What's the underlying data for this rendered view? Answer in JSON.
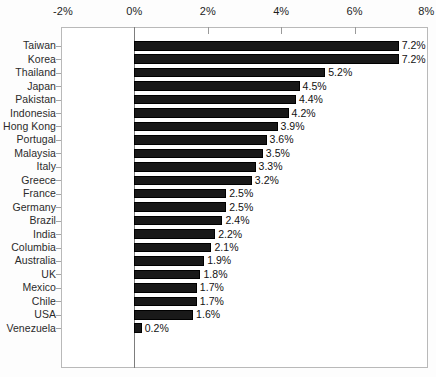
{
  "chart_data": {
    "type": "bar",
    "orientation": "horizontal",
    "title": "",
    "xlabel": "",
    "ylabel": "",
    "xlim": [
      -2,
      8
    ],
    "xticks": [
      "-2%",
      "0%",
      "2%",
      "4%",
      "6%",
      "8%"
    ],
    "xtick_values": [
      -2,
      0,
      2,
      4,
      6,
      8
    ],
    "grid": false,
    "legend": null,
    "value_suffix": "%",
    "categories": [
      "Taiwan",
      "Korea",
      "Thailand",
      "Japan",
      "Pakistan",
      "Indonesia",
      "Hong Kong",
      "Portugal",
      "Malaysia",
      "Italy",
      "Greece",
      "France",
      "Germany",
      "Brazil",
      "India",
      "Columbia",
      "Australia",
      "UK",
      "Mexico",
      "Chile",
      "USA",
      "Venezuela"
    ],
    "values": [
      7.2,
      7.2,
      5.2,
      4.5,
      4.4,
      4.2,
      3.9,
      3.6,
      3.5,
      3.3,
      3.2,
      2.5,
      2.5,
      2.4,
      2.2,
      2.1,
      1.9,
      1.8,
      1.7,
      1.7,
      1.6,
      0.2
    ],
    "value_labels": [
      "7.2%",
      "7.2%",
      "5.2%",
      "4.5%",
      "4.4%",
      "4.2%",
      "3.9%",
      "3.6%",
      "3.5%",
      "3.3%",
      "3.2%",
      "2.5%",
      "2.5%",
      "2.4%",
      "2.2%",
      "2.1%",
      "1.9%",
      "1.8%",
      "1.7%",
      "1.7%",
      "1.6%",
      "0.2%"
    ],
    "bar_color": "#191919",
    "frame_color": "#b9b9b9",
    "background_color": "#ffffff"
  }
}
